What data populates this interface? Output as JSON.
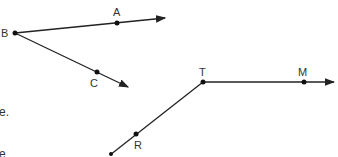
{
  "figure": {
    "angle1": {
      "vertex": {
        "label": "B",
        "x": 15,
        "y": 33
      },
      "ray1": {
        "point": {
          "label": "A",
          "x": 117,
          "y": 23
        },
        "end": {
          "x": 165,
          "y": 18
        }
      },
      "ray2": {
        "point": {
          "label": "C",
          "x": 97,
          "y": 72
        },
        "end": {
          "x": 128,
          "y": 87
        }
      }
    },
    "angle2": {
      "vertex": {
        "label": "T",
        "x": 203,
        "y": 82
      },
      "ray1": {
        "point": {
          "label": "M",
          "x": 304,
          "y": 82
        },
        "end": {
          "x": 334,
          "y": 82
        }
      },
      "ray2": {
        "point": {
          "label": "R",
          "x": 136,
          "y": 135
        },
        "end": {
          "x": 110,
          "y": 156
        }
      }
    },
    "text_fragments": [
      "e.",
      "e"
    ],
    "line_color": "#222222"
  }
}
